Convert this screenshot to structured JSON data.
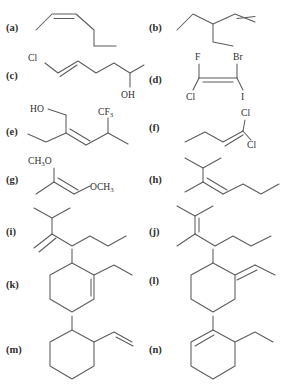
{
  "page": {
    "background_color": "#ffffff",
    "bond_color": "#5c5c5c",
    "label_color": "#2f2f2f",
    "tag_color": "#2e2e2e"
  },
  "structures": [
    {
      "id": "a",
      "tag": "(a)",
      "column": "left",
      "description": "cis-disubstituted alkene, five-carbon chain",
      "atom_labels": [],
      "bond_count": 5,
      "double_bonds": 1
    },
    {
      "id": "b",
      "tag": "(b)",
      "column": "right",
      "description": "3-ethyl-1-pentene; terminal alkene with two ethyl branches",
      "atom_labels": [],
      "bond_count": 7,
      "double_bonds": 1
    },
    {
      "id": "c",
      "tag": "(c)",
      "column": "left",
      "description": "chloro-substituted trans alkene chain ending in secondary alcohol",
      "atom_labels": [
        "Cl",
        "OH"
      ],
      "bond_count": 8,
      "double_bonds": 1
    },
    {
      "id": "d",
      "tag": "(d)",
      "column": "right",
      "description": "tetrahalogenated alkene",
      "atom_labels": [
        "F",
        "Br",
        "Cl",
        "I"
      ],
      "bond_count": 5,
      "double_bonds": 1
    },
    {
      "id": "e",
      "tag": "(e)",
      "column": "left",
      "description": "allylic alcohol with ethyl branch and trifluoromethyl isopropyl terminus",
      "atom_labels": [
        "HO",
        "CF3"
      ],
      "bond_count": 9,
      "double_bonds": 1
    },
    {
      "id": "f",
      "tag": "(f)",
      "column": "right",
      "description": "1,1-dichloro-1-butene",
      "atom_labels": [
        "Cl",
        "Cl"
      ],
      "bond_count": 5,
      "double_bonds": 1
    },
    {
      "id": "g",
      "tag": "(g)",
      "column": "left",
      "description": "enol diether: methoxy groups on both alkene carbons",
      "atom_labels": [
        "CH3O",
        "OCH3"
      ],
      "bond_count": 5,
      "double_bonds": 1
    },
    {
      "id": "h",
      "tag": "(h)",
      "column": "right",
      "description": "trisubstituted alkene with isopropyl, methyl and propyl groups",
      "atom_labels": [],
      "bond_count": 8,
      "double_bonds": 1
    },
    {
      "id": "i",
      "tag": "(i)",
      "column": "left",
      "description": "1,1-disubstituted terminal alkene with isopropyl and butyl chain",
      "atom_labels": [],
      "bond_count": 8,
      "double_bonds": 1
    },
    {
      "id": "j",
      "tag": "(j)",
      "column": "right",
      "description": "tetrasubstituted alkene with two methyls and two alkyl chains",
      "atom_labels": [],
      "bond_count": 9,
      "double_bonds": 1
    },
    {
      "id": "k",
      "tag": "(k)",
      "column": "left",
      "description": "1-ethyl-6-methylcyclohexene",
      "atom_labels": [],
      "bond_count": 9,
      "double_bonds": 1
    },
    {
      "id": "l",
      "tag": "(l)",
      "column": "right",
      "description": "ethylidene cyclohexane bearing a methyl group",
      "atom_labels": [],
      "bond_count": 9,
      "double_bonds": 1
    },
    {
      "id": "m",
      "tag": "(m)",
      "column": "left",
      "description": "1-methyl-2-vinylcyclohexane",
      "atom_labels": [],
      "bond_count": 9,
      "double_bonds": 1
    },
    {
      "id": "n",
      "tag": "(n)",
      "column": "right",
      "description": "2-ethyl-1-methylcyclohexene",
      "atom_labels": [],
      "bond_count": 9,
      "double_bonds": 1
    }
  ],
  "atom_text": {
    "cl": "Cl",
    "oh": "OH",
    "ho": "HO",
    "f": "F",
    "br": "Br",
    "i": "I",
    "cf3_main": "CF",
    "cf3_sub": "3",
    "ch3o_main": "CH",
    "ch3o_sub": "3",
    "ch3o_tail": "O",
    "och3_main": "OCH",
    "och3_sub": "3"
  }
}
